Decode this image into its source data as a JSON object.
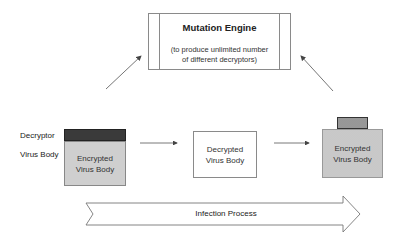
{
  "mutation_engine": {
    "title": "Mutation Engine",
    "subtitle_line1": "(to produce unlimited number",
    "subtitle_line2": "of different decryptors)"
  },
  "labels": {
    "decryptor": "Decryptor",
    "virus_body": "Virus Body"
  },
  "stages": [
    {
      "line1": "Encrypted",
      "line2": "Virus Body",
      "style": "solid-gray",
      "has_decryptor": true,
      "decryptor_style": "dark"
    },
    {
      "line1": "Decrypted",
      "line2": "Virus Body",
      "style": "white",
      "has_decryptor": false
    },
    {
      "line1": "Encrypted",
      "line2": "Virus Body",
      "style": "dotted",
      "has_decryptor": true,
      "decryptor_style": "checkered"
    }
  ],
  "process_arrow": {
    "label": "Infection Process"
  },
  "colors": {
    "line": "#555555",
    "decryptor_dark": "#3a3a3a",
    "body_gray": "#cfcfcf"
  }
}
